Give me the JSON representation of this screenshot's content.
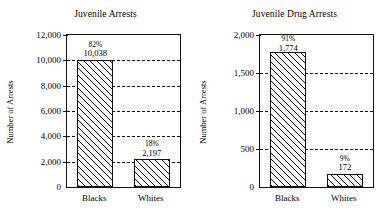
{
  "chart_data": [
    {
      "id": "juvenile-arrests",
      "type": "bar",
      "title": "Juvenile Arrests",
      "xlabel": "",
      "ylabel": "Number of Arrests",
      "categories": [
        "Blacks",
        "Whites"
      ],
      "values": [
        10038,
        2197
      ],
      "value_labels": [
        "10,038",
        "2,197"
      ],
      "percent_labels": [
        "82%",
        "18%"
      ],
      "percents": [
        82,
        18
      ],
      "ylim": [
        0,
        12000
      ],
      "ytick_values": [
        0,
        2000,
        4000,
        6000,
        8000,
        10000,
        12000
      ],
      "ytick_labels": [
        "0",
        "2,000",
        "4,000",
        "6,000",
        "8,000",
        "10,000",
        "12,000"
      ],
      "grid": "horizontal-dashed",
      "legend": "none",
      "bar_fill": "diagonal-hatch",
      "bar_color": "#ffffff",
      "line_color": "#111111"
    },
    {
      "id": "juvenile-drug-arrests",
      "type": "bar",
      "title": "Juvenile Drug Arrests",
      "xlabel": "",
      "ylabel": "Number of Arrests",
      "categories": [
        "Blacks",
        "Whites"
      ],
      "values": [
        1774,
        172
      ],
      "value_labels": [
        "1,774",
        "172"
      ],
      "percent_labels": [
        "91%",
        "9%"
      ],
      "percents": [
        91,
        9
      ],
      "ylim": [
        0,
        2000
      ],
      "ytick_values": [
        0,
        500,
        1000,
        1500,
        2000
      ],
      "ytick_labels": [
        "0",
        "500",
        "1,000",
        "1,500",
        "2,000"
      ],
      "grid": "horizontal-dashed",
      "legend": "none",
      "bar_fill": "diagonal-hatch",
      "bar_color": "#ffffff",
      "line_color": "#111111"
    }
  ]
}
